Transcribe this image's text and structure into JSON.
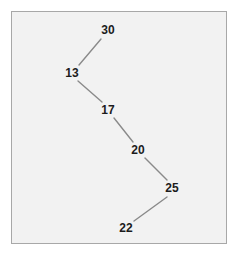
{
  "figure": {
    "type": "node-path-diagram",
    "background_color": "#ffffff",
    "panel": {
      "fill_color": "#f2f2f2",
      "border_color": "#a8a8a8",
      "x": 11,
      "y": 11,
      "width": 216,
      "height": 233
    },
    "edge_color": "#8a8a8a",
    "edge_width": 1.4,
    "label_color": "#1c1c1c"
  },
  "chart_data": {
    "type": "line",
    "title": "",
    "xlabel": "",
    "ylabel": "",
    "grid": false,
    "legend": null,
    "node_labels": [
      "30",
      "13",
      "17",
      "20",
      "25",
      "22"
    ],
    "values": [
      30,
      13,
      17,
      20,
      25,
      22
    ],
    "nodes": [
      {
        "label": "30",
        "x": 108,
        "y": 30
      },
      {
        "label": "13",
        "x": 72,
        "y": 73
      },
      {
        "label": "17",
        "x": 108,
        "y": 110
      },
      {
        "label": "20",
        "x": 138,
        "y": 150
      },
      {
        "label": "25",
        "x": 172,
        "y": 188
      },
      {
        "label": "22",
        "x": 126,
        "y": 228
      }
    ],
    "edges": [
      {
        "from": "30",
        "to": "13",
        "x1": 101,
        "y1": 39,
        "x2": 79,
        "y2": 65
      },
      {
        "from": "13",
        "to": "17",
        "x1": 78,
        "y1": 81,
        "x2": 102,
        "y2": 102
      },
      {
        "from": "17",
        "to": "20",
        "x1": 114,
        "y1": 118,
        "x2": 133,
        "y2": 142
      },
      {
        "from": "20",
        "to": "25",
        "x1": 145,
        "y1": 158,
        "x2": 167,
        "y2": 180
      },
      {
        "from": "25",
        "to": "22",
        "x1": 167,
        "y1": 197,
        "x2": 134,
        "y2": 221
      }
    ]
  }
}
